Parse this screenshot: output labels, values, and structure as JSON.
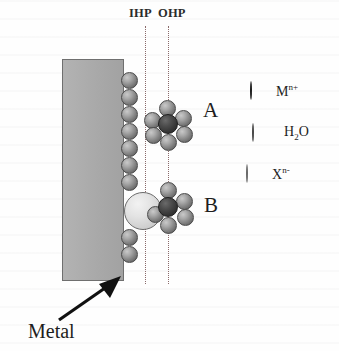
{
  "figure": {
    "background_color": "#fefefe"
  },
  "electrode": {
    "label": "Metal",
    "fill_color": "#a9a9a9",
    "border_color": "#6f6f6f"
  },
  "planes": [
    {
      "id": "ihp",
      "label": "IHP",
      "x": 145,
      "line_style": "dotted",
      "color": "#8a6a6a"
    },
    {
      "id": "ohp",
      "label": "OHP",
      "x": 168,
      "line_style": "dotted",
      "color": "#8a6a6a"
    }
  ],
  "clusters": [
    {
      "id": "a",
      "label": "A",
      "description": "hydrated metal cation at the outer Helmholtz plane"
    },
    {
      "id": "b",
      "label": "B",
      "description": "specifically adsorbed anion at the inner Helmholtz plane"
    }
  ],
  "legend": {
    "items": [
      {
        "id": "cation",
        "symbol": "M",
        "superscript": "n+",
        "subscript": "",
        "color": "#333333",
        "radius_px": 10
      },
      {
        "id": "water",
        "symbol": "H",
        "superscript": "",
        "subscript": "2",
        "symbol_tail": "O",
        "color": "#7e7e7e",
        "radius_px": 8
      },
      {
        "id": "anion",
        "symbol": "X",
        "superscript": "n-",
        "subscript": "",
        "color": "#e3e3e3",
        "radius_px": 19
      }
    ]
  },
  "surface_water_column": {
    "count_upper": 7,
    "count_lower": 2,
    "description": "water molecules adsorbed along the metal surface"
  },
  "species_counts": {
    "cluster_a_waters": 6,
    "cluster_a_cations": 1,
    "cluster_b_waters": 5,
    "cluster_b_cations": 1,
    "cluster_b_anions": 1
  }
}
